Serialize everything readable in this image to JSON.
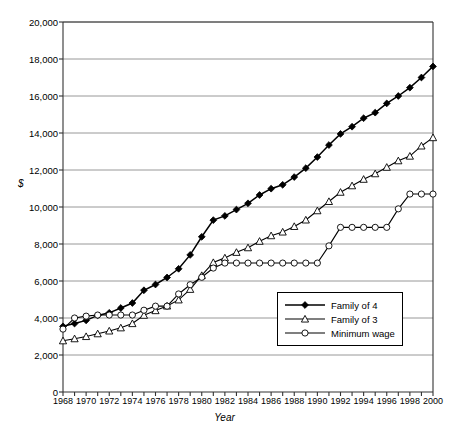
{
  "chart_data": {
    "type": "line",
    "title": "",
    "xlabel": "Year",
    "ylabel": "$",
    "xlim": [
      1968,
      2000
    ],
    "ylim": [
      0,
      20000
    ],
    "ytick_step": 2000,
    "xtick_step": 2,
    "grid": true,
    "legend_position": "inside-lower-right",
    "ytick_labels": [
      "0",
      "2,000",
      "4,000",
      "6,000",
      "8,000",
      "10,000",
      "12,000",
      "14,000",
      "16,000",
      "18,000",
      "20,000"
    ],
    "xtick_labels": [
      "1968",
      "1970",
      "1972",
      "1974",
      "1976",
      "1978",
      "1980",
      "1982",
      "1984",
      "1986",
      "1988",
      "1990",
      "1992",
      "1994",
      "1996",
      "1998",
      "2000"
    ],
    "x": [
      1968,
      1969,
      1970,
      1971,
      1972,
      1973,
      1974,
      1975,
      1976,
      1977,
      1978,
      1979,
      1980,
      1981,
      1982,
      1983,
      1984,
      1985,
      1986,
      1987,
      1988,
      1989,
      1990,
      1991,
      1992,
      1993,
      1994,
      1995,
      1996,
      1997,
      1998,
      1999,
      2000
    ],
    "series": [
      {
        "name": "Family of 4",
        "marker": "filled-diamond",
        "color": "#000000",
        "values": [
          3550,
          3700,
          3870,
          4140,
          4280,
          4540,
          4810,
          5500,
          5810,
          6190,
          6660,
          7410,
          8390,
          9290,
          9520,
          9860,
          10200,
          10650,
          10990,
          11200,
          11620,
          12100,
          12700,
          13350,
          13950,
          14340,
          14800,
          15100,
          15600,
          16000,
          16450,
          17000,
          17600
        ]
      },
      {
        "name": "Family of 3",
        "marker": "open-triangle",
        "color": "#000000",
        "values": [
          2770,
          2880,
          3000,
          3150,
          3300,
          3470,
          3700,
          4150,
          4400,
          4650,
          4980,
          5550,
          6300,
          7000,
          7250,
          7550,
          7800,
          8150,
          8450,
          8650,
          8950,
          9300,
          9800,
          10300,
          10800,
          11150,
          11500,
          11800,
          12150,
          12500,
          12750,
          13300,
          13750
        ]
      },
      {
        "name": "Minimum wage",
        "marker": "open-circle",
        "color": "#000000",
        "values": [
          3400,
          4000,
          4100,
          4160,
          4160,
          4160,
          4160,
          4420,
          4640,
          4640,
          5300,
          5800,
          6200,
          6700,
          6970,
          6970,
          6970,
          6970,
          6970,
          6970,
          6970,
          6970,
          6970,
          7900,
          8900,
          8900,
          8900,
          8900,
          8900,
          9900,
          10700,
          10700,
          10700
        ]
      }
    ]
  },
  "legend": {
    "items": [
      {
        "label": "Family of 4",
        "marker": "filled-diamond"
      },
      {
        "label": "Family of 3",
        "marker": "open-triangle"
      },
      {
        "label": "Minimum wage",
        "marker": "open-circle"
      }
    ]
  }
}
